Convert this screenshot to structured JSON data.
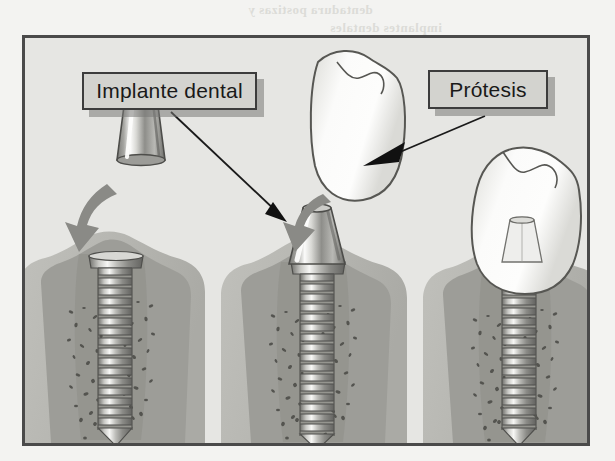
{
  "page": {
    "background_color": "#f3f3f1",
    "showthrough_lines": [
      {
        "text": "dentadura postizas y",
        "x": 248,
        "y": 2,
        "size": 13
      },
      {
        "text": "implantes dentales",
        "x": 330,
        "y": 20,
        "size": 13
      },
      {
        "text": "las prótesis",
        "x": 40,
        "y": 185,
        "size": 13
      },
      {
        "text": "dental y el",
        "x": 470,
        "y": 160,
        "size": 13
      },
      {
        "text": "puente fijo",
        "x": 462,
        "y": 192,
        "size": 13
      },
      {
        "text": "hueso",
        "x": 475,
        "y": 222,
        "size": 13
      },
      {
        "text": "corona",
        "x": 470,
        "y": 250,
        "size": 13
      }
    ]
  },
  "figure": {
    "name": "dental-implant-stages-diagram",
    "frame_color": "#4a4a4a",
    "canvas_color": "#e6e6e3",
    "labels": [
      {
        "id": "implant",
        "text": "Implante dental",
        "box_color": "#d3d3cf",
        "border_color": "#3c3c3c",
        "text_color": "#191919"
      },
      {
        "id": "prosthesis",
        "text": "Prótesis",
        "box_color": "#d3d3cf",
        "border_color": "#3c3c3c",
        "text_color": "#191919"
      }
    ],
    "colors": {
      "bone_outer": "#b9b9b4",
      "bone_inner": "#9d9d98",
      "gum": "#8f8f8a",
      "metal_light": "#f2f2f0",
      "metal_mid": "#a8a8a4",
      "metal_dark": "#6d6d69",
      "crown_white": "#fbfbfa",
      "crown_outline": "#575753",
      "gray_arrow": "#8a8a86",
      "pointer_line": "#1a1a1a",
      "trabecular_speckle": "#4d4d49"
    },
    "stages": [
      {
        "id": "stage-1",
        "order": 1,
        "description": "Implante osteointegrado con pilar separado",
        "parts": [
          "abutment-detached",
          "placement-arrow",
          "implant-screw",
          "bone",
          "gum"
        ]
      },
      {
        "id": "stage-2",
        "order": 2,
        "description": "Pilar montado sobre el implante, corona separada",
        "parts": [
          "abutment-attached",
          "implant-screw",
          "bone",
          "gum",
          "crown-detached",
          "placement-arrow"
        ]
      },
      {
        "id": "stage-3",
        "order": 3,
        "description": "Restauración completa: corona cementada sobre el pilar",
        "parts": [
          "crown-seated",
          "abutment-hidden",
          "implant-screw",
          "bone",
          "gum"
        ]
      }
    ],
    "annotations": [
      {
        "id": "implant-pointer",
        "from_label": "implant",
        "points_to": "stage-2 abutment / implant",
        "style": "thin-line-with-solid-arrowhead"
      },
      {
        "id": "prosthesis-pointer",
        "from_label": "prosthesis",
        "points_to": "floating crown",
        "style": "thin-line-with-solid-arrowhead"
      }
    ]
  }
}
